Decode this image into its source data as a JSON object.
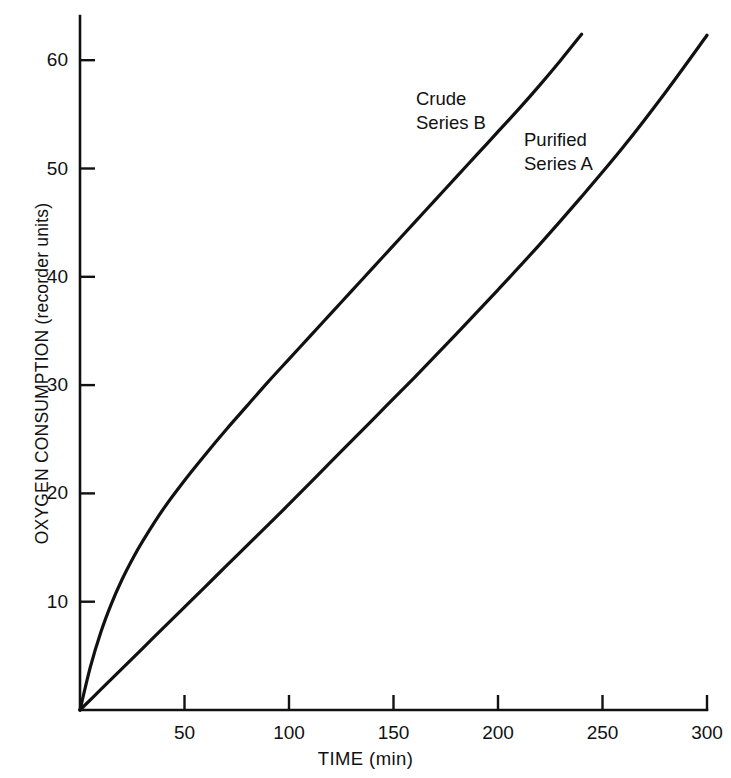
{
  "chart_data": {
    "type": "line",
    "title": "",
    "xlabel": "TIME (min)",
    "ylabel": "OXYGEN CONSUMPTION (recorder units)",
    "xlim": [
      0,
      300
    ],
    "ylim": [
      0,
      66
    ],
    "grid": false,
    "legend_position": "inline-annotations",
    "xticks": [
      50,
      100,
      150,
      200,
      250,
      300
    ],
    "xtick_labels": [
      "50",
      "100",
      "150",
      "200",
      "250",
      "300"
    ],
    "yticks": [
      10,
      20,
      30,
      40,
      50,
      60
    ],
    "ytick_labels": [
      "10",
      "20",
      "30",
      "40",
      "50",
      "60"
    ],
    "line_color": "#111111",
    "background_color": "#ffffff",
    "series": [
      {
        "name": "Crude Series B",
        "annotation_line1": "Crude",
        "annotation_line2": "Series B",
        "x": [
          0,
          5,
          10,
          15,
          20,
          25,
          30,
          40,
          50,
          60,
          70,
          80,
          90,
          100,
          110,
          120,
          130,
          140,
          150,
          160,
          170,
          180,
          190,
          200,
          210,
          220,
          230,
          240
        ],
        "y": [
          0,
          4.0,
          7.2,
          9.8,
          12.0,
          13.9,
          15.6,
          18.6,
          21.2,
          23.6,
          25.9,
          28.1,
          30.3,
          32.4,
          34.5,
          36.6,
          38.7,
          40.8,
          42.9,
          45.0,
          47.1,
          49.2,
          51.3,
          53.4,
          55.5,
          57.7,
          60.0,
          62.4
        ]
      },
      {
        "name": "Purified Series A",
        "annotation_line1": "Purified",
        "annotation_line2": "Series A",
        "x": [
          0,
          10,
          20,
          30,
          40,
          50,
          60,
          70,
          80,
          90,
          100,
          120,
          140,
          160,
          180,
          200,
          220,
          240,
          260,
          280,
          300
        ],
        "y": [
          0,
          1.9,
          3.8,
          5.7,
          7.6,
          9.5,
          11.4,
          13.3,
          15.2,
          17.1,
          19.0,
          22.9,
          26.8,
          30.7,
          34.7,
          38.8,
          43.0,
          47.4,
          52.0,
          57.0,
          62.3
        ]
      }
    ]
  },
  "axis_titles": {
    "x": "TIME (min)",
    "y": "OXYGEN CONSUMPTION (recorder units)"
  }
}
